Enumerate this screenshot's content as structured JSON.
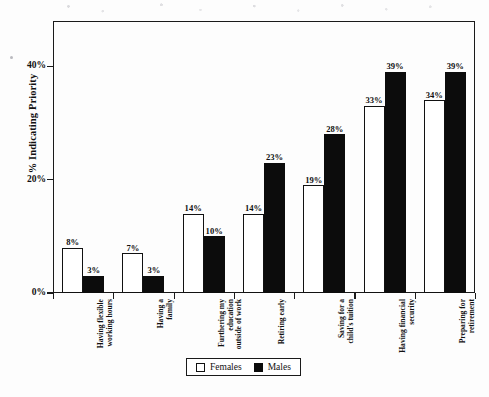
{
  "chart_data": {
    "type": "bar",
    "title": "",
    "subtitle": "",
    "xlabel": "",
    "ylabel": "% Indicating Priority",
    "ylim": [
      0,
      48
    ],
    "yticks": [
      0,
      20,
      40
    ],
    "ytick_labels": [
      "0%",
      "20%",
      "40%"
    ],
    "grid": false,
    "legend_position": "bottom-center",
    "orientation": "vertical",
    "grouping": "clustered",
    "value_label_suffix": "%",
    "categories": [
      "Having flexible working hours",
      "Having a family",
      "Furthering my education outside of work",
      "Retiring early",
      "Saving for a child's tuition",
      "Having financial security",
      "Preparing for retirement"
    ],
    "category_lines": [
      [
        "Having flexible",
        "working hours"
      ],
      [
        "Having a",
        "family"
      ],
      [
        "Furthering my",
        "education",
        "outside of work"
      ],
      [
        "Retiring early"
      ],
      [
        "Saving for a",
        "child's tuition"
      ],
      [
        "Having financial",
        "security"
      ],
      [
        "Preparing for",
        "retirement"
      ]
    ],
    "series": [
      {
        "name": "Females",
        "color": "#ffffff",
        "edge_color": "#111111",
        "values": [
          8,
          7,
          14,
          14,
          19,
          33,
          34
        ],
        "value_labels": [
          "8%",
          "7%",
          "14%",
          "14%",
          "19%",
          "33%",
          "34%"
        ]
      },
      {
        "name": "Males",
        "color": "#0c0c0c",
        "edge_color": "#0c0c0c",
        "values": [
          3,
          3,
          10,
          23,
          28,
          39,
          39
        ],
        "value_labels": [
          "3%",
          "3%",
          "10%",
          "23%",
          "28%",
          "39%",
          "39%"
        ]
      }
    ]
  },
  "legend": {
    "items": [
      {
        "label": "Females",
        "swatch": "white-square"
      },
      {
        "label": "Males",
        "swatch": "black-square"
      }
    ]
  },
  "colors": {
    "axis": "#1a1a1a",
    "female_fill": "#ffffff",
    "male_fill": "#0c0c0c",
    "text": "#111111",
    "page_background": "#fdfdfd"
  }
}
